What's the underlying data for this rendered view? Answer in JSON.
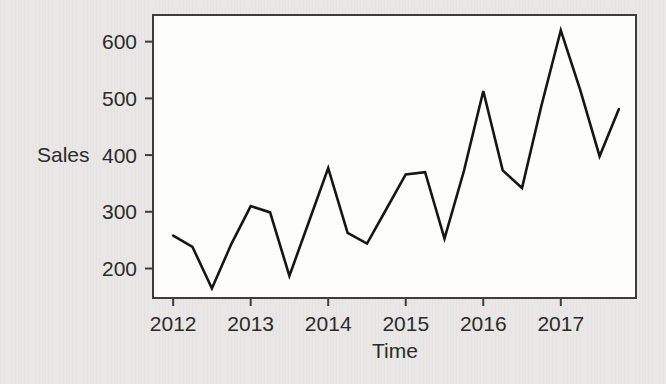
{
  "chart_data": {
    "type": "line",
    "title": "",
    "xlabel": "Time",
    "ylabel": "Sales",
    "frequency": "quarterly",
    "x": [
      2012.0,
      2012.25,
      2012.5,
      2012.75,
      2013.0,
      2013.25,
      2013.5,
      2013.75,
      2014.0,
      2014.25,
      2014.5,
      2014.75,
      2015.0,
      2015.25,
      2015.5,
      2015.75,
      2016.0,
      2016.25,
      2016.5,
      2016.75,
      2017.0,
      2017.25,
      2017.5,
      2017.75
    ],
    "series": [
      {
        "name": "Sales",
        "values": [
          258,
          238,
          165,
          243,
          310,
          299,
          187,
          282,
          377,
          263,
          244,
          305,
          366,
          370,
          253,
          372,
          513,
          373,
          342,
          487,
          620,
          515,
          398,
          481
        ]
      }
    ],
    "x_ticks": [
      2012,
      2013,
      2014,
      2015,
      2016,
      2017
    ],
    "y_ticks": [
      200,
      300,
      400,
      500,
      600
    ],
    "xlim": [
      2011.74,
      2017.97
    ],
    "ylim": [
      148,
      647
    ],
    "grid": false,
    "legend": "none",
    "colors": {
      "line": "#161616",
      "frame": "#3d3d3d",
      "tick": "#3d3d3d",
      "tick_label": "#2b2b2b",
      "plot_background": "#fdfdfc",
      "page_background": "#e9e8e5"
    }
  }
}
